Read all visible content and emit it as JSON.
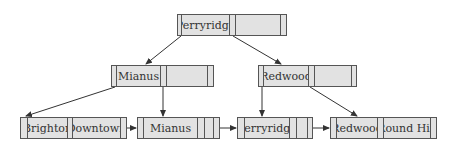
{
  "diagram": {
    "type": "B+ tree",
    "colors": {
      "node_fill": "#e2e2e2",
      "node_border": "#555555",
      "edge": "#333333",
      "background": "#ffffff"
    },
    "root": {
      "keys": [
        "Perryridge",
        ""
      ]
    },
    "internal": [
      {
        "keys": [
          "Mianus",
          ""
        ]
      },
      {
        "keys": [
          "Redwood",
          ""
        ]
      }
    ],
    "leaves": [
      {
        "keys": [
          "Brighton",
          "Downtown"
        ]
      },
      {
        "keys": [
          "Mianus",
          ""
        ]
      },
      {
        "keys": [
          "Perryridge",
          ""
        ]
      },
      {
        "keys": [
          "Redwood",
          "Round Hill"
        ]
      }
    ],
    "edges": [
      {
        "from": "root.p0",
        "to": "internal.0"
      },
      {
        "from": "root.p1",
        "to": "internal.1"
      },
      {
        "from": "internal.0.p0",
        "to": "leaves.0"
      },
      {
        "from": "internal.0.p1",
        "to": "leaves.1"
      },
      {
        "from": "internal.1.p0",
        "to": "leaves.2"
      },
      {
        "from": "internal.1.p1",
        "to": "leaves.3"
      },
      {
        "from": "leaves.0.next",
        "to": "leaves.1"
      },
      {
        "from": "leaves.1.next",
        "to": "leaves.2"
      },
      {
        "from": "leaves.2.next",
        "to": "leaves.3"
      }
    ]
  }
}
